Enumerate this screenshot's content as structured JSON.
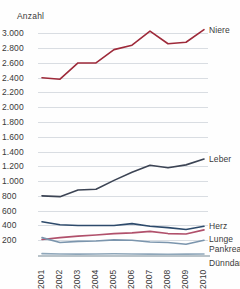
{
  "chart_data": {
    "type": "line",
    "title": "",
    "ylabel": "Anzahl",
    "xlabel": "",
    "categories": [
      "2001",
      "2002",
      "2003",
      "2004",
      "2005",
      "2006",
      "2007",
      "2008",
      "2009",
      "2010"
    ],
    "ylim": [
      0,
      3100
    ],
    "ytick_values": [
      3000,
      2800,
      2600,
      2400,
      2200,
      2000,
      1800,
      1600,
      1400,
      1200,
      1000,
      800,
      600,
      400,
      200
    ],
    "ytick_labels": [
      "3.000",
      "2.800",
      "2.600",
      "2.400",
      "2.200",
      "2.000",
      "1.800",
      "1.600",
      "1.400",
      "1.200",
      "1.000",
      "800",
      "600",
      "400",
      "200"
    ],
    "grid": true,
    "legend_position": "right-inline",
    "series": [
      {
        "name": "Niere",
        "color": "#9e2a3a",
        "values": [
          2400,
          2380,
          2600,
          2600,
          2780,
          2840,
          3030,
          2860,
          2880,
          3050
        ]
      },
      {
        "name": "Leber",
        "color": "#3c4454",
        "values": [
          800,
          790,
          880,
          890,
          1010,
          1120,
          1215,
          1180,
          1220,
          1300
        ]
      },
      {
        "name": "Herz",
        "color": "#2d4a6b",
        "values": [
          450,
          410,
          400,
          400,
          400,
          425,
          390,
          370,
          345,
          390
        ]
      },
      {
        "name": "Lunge",
        "color": "#b0506b",
        "values": [
          210,
          235,
          255,
          270,
          290,
          300,
          320,
          290,
          285,
          340
        ]
      },
      {
        "name": "Pankreas",
        "color": "#7b95ad",
        "values": [
          235,
          170,
          185,
          190,
          205,
          200,
          175,
          170,
          145,
          200
        ]
      },
      {
        "name": "Dünndarm",
        "color": "#8fa7ba",
        "values": [
          18,
          14,
          12,
          14,
          16,
          14,
          12,
          10,
          12,
          14
        ]
      }
    ]
  },
  "colors": {
    "gridline": "#d9dde2",
    "baseline": "#b9c3c9",
    "text": "#3a3a3a",
    "background": "#fefefe"
  }
}
